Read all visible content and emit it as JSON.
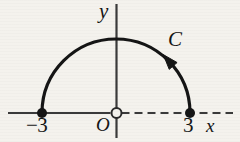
{
  "figure": {
    "background_color": "#f4f2ed",
    "ink_color": "#151515",
    "width": 240,
    "height": 142
  },
  "axes": {
    "x_axis": {
      "label": "x",
      "origin_px": {
        "x": 116,
        "y": 113
      },
      "solid_from_px": 8,
      "dashed_to_px": 233,
      "dash_pattern": "8 5"
    },
    "y_axis": {
      "label": "y",
      "top_px": 4,
      "bottom_px": 138
    },
    "origin": {
      "label": "O",
      "marker": "open-circle",
      "radius_px": 5
    }
  },
  "curve": {
    "label": "C",
    "type": "semicircle",
    "center": {
      "x": 0,
      "y": 0
    },
    "radius": 3,
    "half": "upper",
    "center_px": {
      "x": 116,
      "y": 113
    },
    "radius_px": 74,
    "stroke_width_px": 3.2,
    "orientation": "counterclockwise",
    "arrow": {
      "marker": "arrowhead",
      "angle_deg": 41,
      "direction": "counterclockwise"
    }
  },
  "points": [
    {
      "label": "-3",
      "display": "−3",
      "marker": "filled-dot",
      "x_value": -3,
      "y_value": 0,
      "px": {
        "x": 42,
        "y": 113
      },
      "radius_px": 5
    },
    {
      "label": "3",
      "display": "3",
      "marker": "filled-dot",
      "x_value": 3,
      "y_value": 0,
      "px": {
        "x": 190,
        "y": 113
      },
      "radius_px": 5
    }
  ]
}
